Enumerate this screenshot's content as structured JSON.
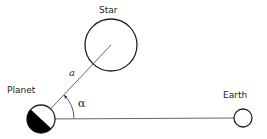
{
  "diagram": {
    "labels": {
      "star": "Star",
      "planet": "Planet",
      "earth": "Earth",
      "distance": "a",
      "angle": "α"
    },
    "bodies": [
      {
        "name": "Star",
        "cx": 111,
        "cy": 45,
        "r": 26
      },
      {
        "name": "Planet",
        "cx": 41,
        "cy": 119,
        "r": 14,
        "phase": "half-illuminated"
      },
      {
        "name": "Earth",
        "cx": 243,
        "cy": 118,
        "r": 9
      }
    ],
    "colors": {
      "line": "#555555",
      "outline": "#222222",
      "shadow": "#000000"
    }
  }
}
